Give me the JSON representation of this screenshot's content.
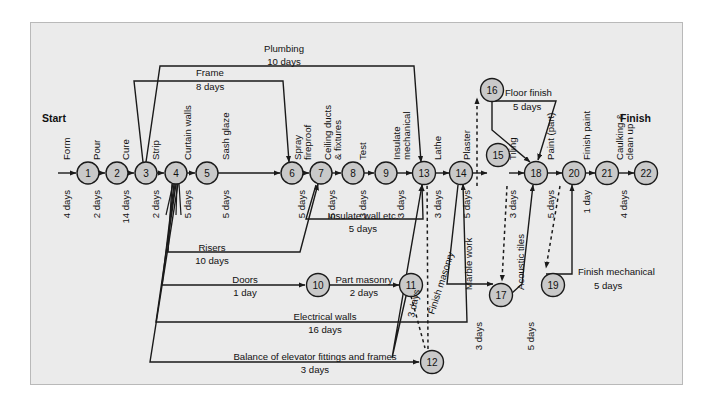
{
  "diagram": {
    "start_label": "Start",
    "finish_label": "Finish",
    "background": "#ebebeb",
    "node_fill": "#c9c9c9",
    "line_color": "#1a1a1a"
  },
  "nodes": [
    {
      "id": "1",
      "x": 88,
      "y": 173
    },
    {
      "id": "2",
      "x": 117,
      "y": 173
    },
    {
      "id": "3",
      "x": 146,
      "y": 173
    },
    {
      "id": "4",
      "x": 176,
      "y": 173
    },
    {
      "id": "5",
      "x": 207,
      "y": 173
    },
    {
      "id": "6",
      "x": 292,
      "y": 173
    },
    {
      "id": "7",
      "x": 321,
      "y": 173
    },
    {
      "id": "8",
      "x": 353,
      "y": 173
    },
    {
      "id": "9",
      "x": 386,
      "y": 173
    },
    {
      "id": "13",
      "x": 424,
      "y": 173
    },
    {
      "id": "14",
      "x": 461,
      "y": 173
    },
    {
      "id": "15",
      "x": 498,
      "y": 155
    },
    {
      "id": "16",
      "x": 492,
      "y": 90
    },
    {
      "id": "18",
      "x": 536,
      "y": 173
    },
    {
      "id": "20",
      "x": 574,
      "y": 173
    },
    {
      "id": "21",
      "x": 607,
      "y": 173
    },
    {
      "id": "22",
      "x": 646,
      "y": 173
    },
    {
      "id": "10",
      "x": 318,
      "y": 285
    },
    {
      "id": "11",
      "x": 411,
      "y": 285
    },
    {
      "id": "12",
      "x": 432,
      "y": 362
    },
    {
      "id": "17",
      "x": 501,
      "y": 295
    },
    {
      "id": "19",
      "x": 553,
      "y": 285
    }
  ],
  "activities": [
    {
      "name": "Form",
      "duration": "4 days"
    },
    {
      "name": "Pour",
      "duration": "2 days"
    },
    {
      "name": "Cure",
      "duration": "14 days"
    },
    {
      "name": "Strip",
      "duration": "2 days"
    },
    {
      "name": "Curtain walls",
      "duration": "5 days"
    },
    {
      "name": "Sash glaze",
      "duration": "5 days"
    },
    {
      "name": "Spray fireproof",
      "duration": "5 days"
    },
    {
      "name": "Ceiling ducts & fixtures",
      "duration": "5 days"
    },
    {
      "name": "Test",
      "duration": "3 days"
    },
    {
      "name": "Insulate mechanical",
      "duration": "3 days"
    },
    {
      "name": "Lathe",
      "duration": "3 days"
    },
    {
      "name": "Plaster",
      "duration": "5 days"
    },
    {
      "name": "Tiling",
      "duration": "3 days"
    },
    {
      "name": "Paint (part)",
      "duration": "5 days"
    },
    {
      "name": "Finish paint",
      "duration": "1 day"
    },
    {
      "name": "Caulking & clean up",
      "duration": "4 days"
    },
    {
      "name": "Plumbing",
      "duration": "10 days"
    },
    {
      "name": "Frame",
      "duration": "8 days"
    },
    {
      "name": "Insulate wall etc.",
      "duration": "5 days"
    },
    {
      "name": "Risers",
      "duration": "10 days"
    },
    {
      "name": "Doors",
      "duration": "1 day"
    },
    {
      "name": "Part masonry",
      "duration": "2 days"
    },
    {
      "name": "Electrical walls",
      "duration": "16 days"
    },
    {
      "name": "Balance of elevator fittings and frames",
      "duration": "3 days"
    },
    {
      "name": "Finish masonry",
      "duration": "3 days"
    },
    {
      "name": "Marble work",
      "duration": "3 days"
    },
    {
      "name": "Acoustic tiles",
      "duration": "5 days"
    },
    {
      "name": "Floor finish",
      "duration": "5 days"
    },
    {
      "name": "Finish mechanical",
      "duration": "5 days"
    }
  ],
  "labels": {
    "start": "Start",
    "finish": "Finish",
    "form": "Form",
    "form_d": "4 days",
    "pour": "Pour",
    "pour_d": "2 days",
    "cure": "Cure",
    "cure_d": "14 days",
    "strip": "Strip",
    "strip_d": "2 days",
    "curtain_walls": "Curtain walls",
    "curtain_walls_d": "5 days",
    "sash_glaze": "Sash glaze",
    "sash_glaze_d": "5 days",
    "spray": "Spray",
    "fireproof": "fireproof",
    "spray_d": "5 days",
    "ceiling_ducts": "Ceiling ducts",
    "fixtures": "& fixtures",
    "ceiling_d": "5 days",
    "test": "Test",
    "test_d": "3 days",
    "insulate": "Insulate",
    "mechanical": "mechanical",
    "insulate_mech_d": "3 days",
    "lathe": "Lathe",
    "lathe_d": "3 days",
    "plaster": "Plaster",
    "plaster_d": "5 days",
    "tiling": "Tiling",
    "tiling_d": "3 days",
    "paint_part": "Paint (part)",
    "paint_part_d": "5 days",
    "finish_paint": "Finish paint",
    "finish_paint_d": "1 day",
    "caulking": "Caulking &",
    "cleanup": "clean up",
    "caulking_d": "4 days",
    "plumbing": "Plumbing",
    "plumbing_d": "10 days",
    "frame": "Frame",
    "frame_d": "8 days",
    "insulate_wall": "Insulate wall etc.",
    "insulate_wall_d": "5 days",
    "risers": "Risers",
    "risers_d": "10 days",
    "doors": "Doors",
    "doors_d": "1 day",
    "part_masonry": "Part masonry",
    "part_masonry_d": "2 days",
    "electrical_walls": "Electrical walls",
    "electrical_walls_d": "16 days",
    "balance_elevator": "Balance of elevator fittings and frames",
    "balance_elevator_d": "3 days",
    "finish_masonry": "Finish masonry",
    "finish_masonry_d": "3 days",
    "marble_work": "Marble work",
    "marble_work_d": "3 days",
    "acoustic_tiles": "Acoustic tiles",
    "acoustic_tiles_d": "5 days",
    "floor_finish": "Floor finish",
    "floor_finish_d": "5 days",
    "finish_mechanical": "Finish mechanical",
    "finish_mechanical_d": "5 days"
  },
  "node_ids": {
    "n1": "1",
    "n2": "2",
    "n3": "3",
    "n4": "4",
    "n5": "5",
    "n6": "6",
    "n7": "7",
    "n8": "8",
    "n9": "9",
    "n10": "10",
    "n11": "11",
    "n12": "12",
    "n13": "13",
    "n14": "14",
    "n15": "15",
    "n16": "16",
    "n17": "17",
    "n18": "18",
    "n19": "19",
    "n20": "20",
    "n21": "21",
    "n22": "22"
  }
}
